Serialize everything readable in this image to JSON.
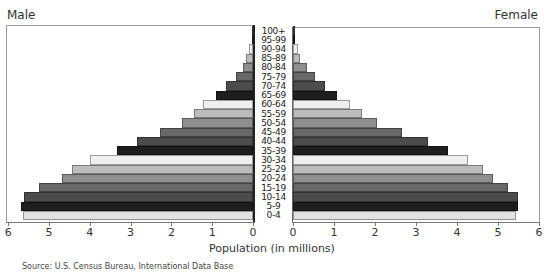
{
  "chart_data": {
    "type": "bar",
    "subtype": "population-pyramid",
    "title": "",
    "xlabel": "Population (in millions)",
    "ylabel": "",
    "left_title": "Male",
    "right_title": "Female",
    "source": "Source: U.S. Census Bureau, International Data Base",
    "xlim": [
      0,
      6
    ],
    "x_ticks": [
      0,
      1,
      2,
      3,
      4,
      5,
      6
    ],
    "grid": false,
    "legend": "none",
    "categories": [
      "0-4",
      "5-9",
      "10-14",
      "15-19",
      "20-24",
      "25-29",
      "30-34",
      "35-39",
      "40-44",
      "45-49",
      "50-54",
      "55-59",
      "60-64",
      "65-69",
      "70-74",
      "75-79",
      "80-84",
      "85-89",
      "90-94",
      "95-99",
      "100+"
    ],
    "series": [
      {
        "name": "Male",
        "values": [
          5.63,
          5.69,
          5.61,
          5.25,
          4.68,
          4.44,
          4.0,
          3.33,
          2.84,
          2.28,
          1.74,
          1.45,
          1.22,
          0.9,
          0.66,
          0.42,
          0.25,
          0.17,
          0.1,
          0.03,
          0.01
        ]
      },
      {
        "name": "Female",
        "values": [
          5.44,
          5.49,
          5.49,
          5.24,
          4.88,
          4.63,
          4.27,
          3.78,
          3.29,
          2.66,
          2.05,
          1.68,
          1.39,
          1.07,
          0.78,
          0.54,
          0.34,
          0.17,
          0.12,
          0.05,
          0.01
        ]
      }
    ],
    "bar_colors_cycle": [
      "#e2e2e2",
      "#1e1e1e",
      "#4c4c4c",
      "#686868",
      "#8e8e8e",
      "#bcbcbc",
      "#efefef"
    ]
  },
  "labels": {
    "male": "Male",
    "female": "Female",
    "xlabel": "Population (in millions)",
    "source": "Source: U.S. Census Bureau, International Data Base"
  }
}
